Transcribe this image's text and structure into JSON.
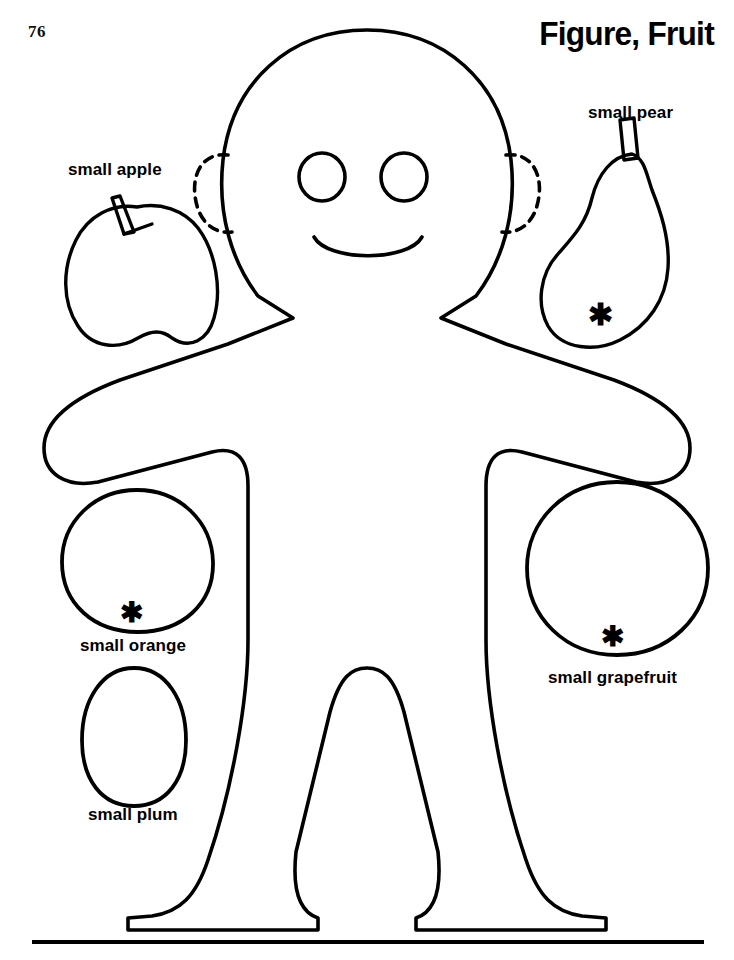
{
  "page": {
    "number": "76",
    "title": "Figure, Fruit",
    "width": 734,
    "height": 960,
    "background_color": "#ffffff",
    "ink_color": "#000000"
  },
  "figure": {
    "name": "gingerbread-person-outline",
    "features": [
      "head",
      "left-eye",
      "right-eye",
      "smile",
      "left-dashed-ear",
      "right-dashed-ear",
      "torso",
      "left-arm",
      "right-arm",
      "left-hand",
      "right-hand",
      "left-leg",
      "right-leg",
      "left-foot",
      "right-foot"
    ]
  },
  "fruits": [
    {
      "id": "apple",
      "label": "small apple",
      "shape": "apple",
      "has_stem": true,
      "has_asterisk": false,
      "label_position": "above"
    },
    {
      "id": "pear",
      "label": "small pear",
      "shape": "pear",
      "has_stem": true,
      "has_asterisk": true,
      "label_position": "above"
    },
    {
      "id": "orange",
      "label": "small orange",
      "shape": "circle",
      "has_stem": false,
      "has_asterisk": true,
      "label_position": "below"
    },
    {
      "id": "plum",
      "label": "small plum",
      "shape": "oval",
      "has_stem": false,
      "has_asterisk": false,
      "label_position": "below"
    },
    {
      "id": "grapefruit",
      "label": "small grapefruit",
      "shape": "circle",
      "has_stem": false,
      "has_asterisk": true,
      "label_position": "below"
    }
  ],
  "marks": {
    "asterisk_glyph": "*",
    "asterisk_meaning": "cut-placement mark"
  },
  "footer": {
    "rule": "horizontal-rule"
  }
}
